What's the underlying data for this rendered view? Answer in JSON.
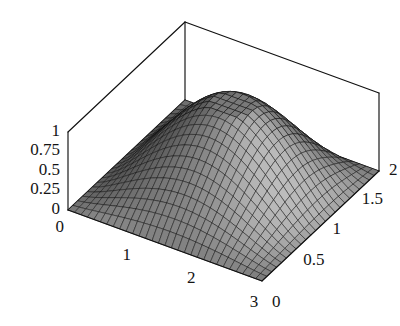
{
  "figure": {
    "type": "surface3d",
    "background_color": "#ffffff",
    "line_color": "#101010",
    "surface_dark_color": "#4a4a4a",
    "surface_light_color": "#b4b4b4"
  },
  "chart_data": {
    "type": "surface",
    "title": "",
    "xlabel": "",
    "ylabel": "",
    "zlabel": "",
    "xlim": [
      0,
      3
    ],
    "ylim": [
      0,
      2
    ],
    "zlim": [
      0,
      1
    ],
    "grid": false,
    "legend": "none",
    "x_ticks": [
      "0",
      "1",
      "2",
      "3"
    ],
    "x_tick_values": [
      0,
      1,
      2,
      3
    ],
    "y_ticks": [
      "0",
      "0.5",
      "1",
      "1.5",
      "2"
    ],
    "y_tick_values": [
      0,
      0.5,
      1,
      1.5,
      2
    ],
    "z_ticks": [
      "0",
      "0.25",
      "0.5",
      "0.75",
      "1"
    ],
    "z_tick_values": [
      0,
      0.25,
      0.5,
      0.75,
      1
    ],
    "mesh_nx": 30,
    "mesh_ny": 24,
    "peak_value": 1.0,
    "peak_x": 1.5,
    "peak_y": 1.45,
    "z_samples": [
      {
        "x": 0.0,
        "y": 0.0,
        "z": 0.0
      },
      {
        "x": 1.5,
        "y": 0.0,
        "z": 0.0
      },
      {
        "x": 3.0,
        "y": 0.0,
        "z": 0.0
      },
      {
        "x": 0.0,
        "y": 1.0,
        "z": 0.0
      },
      {
        "x": 0.75,
        "y": 1.0,
        "z": 0.36
      },
      {
        "x": 1.5,
        "y": 1.0,
        "z": 0.72
      },
      {
        "x": 2.25,
        "y": 1.0,
        "z": 0.55
      },
      {
        "x": 3.0,
        "y": 1.0,
        "z": 0.0
      },
      {
        "x": 1.5,
        "y": 1.45,
        "z": 1.0
      },
      {
        "x": 1.5,
        "y": 2.0,
        "z": 0.0
      },
      {
        "x": 0.0,
        "y": 2.0,
        "z": 0.0
      },
      {
        "x": 3.0,
        "y": 2.0,
        "z": 0.0
      }
    ]
  },
  "axes": {
    "z_axis": {
      "name": "vertical-axis",
      "labels": [
        "1",
        "0.75",
        "0.5",
        "0.25",
        "0"
      ]
    },
    "x_axis": {
      "name": "front-left-axis",
      "labels": [
        "0",
        "1",
        "2",
        "3"
      ]
    },
    "y_axis": {
      "name": "front-right-axis",
      "labels": [
        "0",
        "0.5",
        "1",
        "1.5",
        "2"
      ]
    }
  },
  "labels": {
    "z1": "1",
    "z075": "0.75",
    "z05": "0.5",
    "z025": "0.25",
    "z0": "0",
    "x0": "0",
    "x1": "1",
    "x2": "2",
    "x3": "3",
    "y0": "0",
    "y05": "0.5",
    "y1": "1",
    "y15": "1.5",
    "y2": "2"
  }
}
